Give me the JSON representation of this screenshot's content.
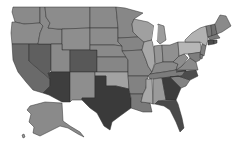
{
  "map": {
    "type": "choropleth",
    "region": "United States",
    "palette": "grayscale",
    "states": [
      {
        "id": "WA",
        "name": "Washington",
        "fill": "#8a8a8a",
        "points": "13,7 40,7 40,23 24,24 15,22 12,12"
      },
      {
        "id": "OR",
        "name": "Oregon",
        "fill": "#8c8c8c",
        "points": "12,22 15,22 24,24 40,23 43,26 40,33 38,44 12,44 11,33"
      },
      {
        "id": "CA",
        "name": "California",
        "fill": "#6a6a6a",
        "points": "12,44 29,44 29,61 50,79 50,86 43,93 33,90 26,82 18,72 13,60"
      },
      {
        "id": "NV",
        "name": "Nevada",
        "fill": "#5f5f5f",
        "points": "29,44 51,44 51,70 48,73 50,79 29,61"
      },
      {
        "id": "ID",
        "name": "Idaho",
        "fill": "#8a8a8a",
        "points": "40,7 45,7 46,17 50,23 48,28 58,29 62,29 62,44 51,44 38,44 40,33 43,26 40,23"
      },
      {
        "id": "MT",
        "name": "Montana",
        "fill": "#8c8c8c",
        "points": "45,7 90,7 90,28 62,29 58,29 48,28 50,23 46,17"
      },
      {
        "id": "WY",
        "name": "Wyoming",
        "fill": "#8e8e8e",
        "points": "62,29 90,28 90,50 62,50"
      },
      {
        "id": "UT",
        "name": "Utah",
        "fill": "#8a8a8a",
        "points": "51,44 62,44 62,50 70,50 70,72 51,72"
      },
      {
        "id": "AZ",
        "name": "Arizona",
        "fill": "#3e3e3e",
        "points": "50,72 70,72 70,102 62,102 49,95 43,93 50,86 50,79 48,73"
      },
      {
        "id": "CO",
        "name": "Colorado",
        "fill": "#585858",
        "points": "70,50 97,50 97,72 70,72"
      },
      {
        "id": "NM",
        "name": "New Mexico",
        "fill": "#8e8e8e",
        "points": "70,72 95,72 95,98 82,98 82,100 72,100 70,102"
      },
      {
        "id": "ND",
        "name": "North Dakota",
        "fill": "#8a8a8a",
        "points": "90,7 116,7 118,28 90,28"
      },
      {
        "id": "SD",
        "name": "South Dakota",
        "fill": "#8c8c8c",
        "points": "90,28 118,28 118,42 122,46 114,45 90,45"
      },
      {
        "id": "NE",
        "name": "Nebraska",
        "fill": "#8a8a8a",
        "points": "90,45 114,45 122,46 126,57 97,57 97,50 90,50"
      },
      {
        "id": "KS",
        "name": "Kansas",
        "fill": "#868686",
        "points": "97,57 126,57 128,60 128,72 97,72"
      },
      {
        "id": "OK",
        "name": "Oklahoma",
        "fill": "#a2a2a2",
        "points": "95,72 128,72 129,89 116,86 106,86 106,76 95,76"
      },
      {
        "id": "TX",
        "name": "Texas",
        "fill": "#3a3a3a",
        "points": "95,76 106,76 106,86 116,86 129,89 131,98 131,108 120,116 112,122 110,130 104,126 97,113 90,108 84,102 82,100 82,98 95,98"
      },
      {
        "id": "MN",
        "name": "Minnesota",
        "fill": "#878787",
        "points": "116,7 125,8 143,13 134,19 132,24 133,32 138,37 118,38 118,28"
      },
      {
        "id": "IA",
        "name": "Iowa",
        "fill": "#858585",
        "points": "118,38 138,37 144,42 142,50 122,51 122,46 118,42"
      },
      {
        "id": "MO",
        "name": "Missouri",
        "fill": "#878787",
        "points": "122,51 142,50 146,60 148,66 152,72 148,76 128,76 128,60 126,57"
      },
      {
        "id": "AR",
        "name": "Arkansas",
        "fill": "#828282",
        "points": "128,76 148,76 146,88 143,94 130,94 129,89"
      },
      {
        "id": "LA",
        "name": "Louisiana",
        "fill": "#7a7a7a",
        "points": "130,94 143,94 141,102 150,103 152,112 143,112 131,108 131,98"
      },
      {
        "id": "WI",
        "name": "Wisconsin",
        "fill": "#a0a0a0",
        "points": "134,19 148,22 154,26 152,40 144,42 138,37 133,32 132,24"
      },
      {
        "id": "IL",
        "name": "Illinois",
        "fill": "#a8a8a8",
        "points": "144,42 152,40 154,50 155,62 152,72 148,66 146,60 142,50"
      },
      {
        "id": "MI",
        "name": "Michigan",
        "fill": "#9c9c9c",
        "points": "158,24 164,26 166,40 160,44 156,40 156,30"
      },
      {
        "id": "IN",
        "name": "Indiana",
        "fill": "#969696",
        "points": "154,46 162,45 163,62 157,66 155,62"
      },
      {
        "id": "OH",
        "name": "Ohio",
        "fill": "#909090",
        "points": "162,45 170,45 178,42 179,56 173,62 163,62"
      },
      {
        "id": "KY",
        "name": "Kentucky",
        "fill": "#8a8a8a",
        "points": "155,64 163,62 173,62 178,64 176,70 164,72 150,74 152,72"
      },
      {
        "id": "TN",
        "name": "Tennessee",
        "fill": "#7c7c7c",
        "points": "148,76 150,74 164,72 176,70 186,70 182,76 150,79"
      },
      {
        "id": "MS",
        "name": "Mississippi",
        "fill": "#a8a8a8",
        "points": "146,79 152,79 153,104 150,103 141,102 143,94 146,88"
      },
      {
        "id": "AL",
        "name": "Alabama",
        "fill": "#9a9a9a",
        "points": "153,79 162,78 166,100 158,101 155,104 153,104"
      },
      {
        "id": "GA",
        "name": "Georgia",
        "fill": "#3c3c3c",
        "points": "162,78 170,77 181,88 176,100 166,100"
      },
      {
        "id": "FL",
        "name": "Florida",
        "fill": "#4a4a4a",
        "points": "155,104 158,101 176,100 178,104 182,118 184,128 180,132 176,122 170,110 164,106"
      },
      {
        "id": "SC",
        "name": "South Carolina",
        "fill": "#828282",
        "points": "170,77 178,76 190,80 186,86 181,88"
      },
      {
        "id": "NC",
        "name": "North Carolina",
        "fill": "#4c4c4c",
        "points": "176,72 196,70 198,76 190,80 178,76 170,77 182,76 186,70"
      },
      {
        "id": "VA",
        "name": "Virginia",
        "fill": "#8a8a8a",
        "points": "176,70 182,66 190,58 196,62 198,70 186,70"
      },
      {
        "id": "WV",
        "name": "West Virginia",
        "fill": "#8e8e8e",
        "points": "173,62 179,56 184,54 188,58 182,66 176,70 178,64"
      },
      {
        "id": "PA",
        "name": "Pennsylvania",
        "fill": "#b6b6b6",
        "points": "178,42 200,42 202,52 190,54 184,54 179,56"
      },
      {
        "id": "NY",
        "name": "New York",
        "fill": "#b2b2b2",
        "points": "185,40 192,33 200,28 206,26 208,40 206,46 200,42 185,42"
      },
      {
        "id": "MD",
        "name": "Maryland",
        "fill": "#7e7e7e",
        "points": "188,54 202,52 200,60 196,62 190,58"
      },
      {
        "id": "NJ",
        "name": "New Jersey",
        "fill": "#808080",
        "points": "202,44 206,46 204,56 200,54"
      },
      {
        "id": "VT",
        "name": "Vermont",
        "fill": "#7a7a7a",
        "points": "206,26 211,25 212,36 208,37"
      },
      {
        "id": "NH",
        "name": "New Hampshire",
        "fill": "#707070",
        "points": "211,25 215,24 217,34 212,36"
      },
      {
        "id": "ME",
        "name": "Maine",
        "fill": "#8a8a8a",
        "points": "215,24 220,15 226,16 231,26 222,32 217,34"
      },
      {
        "id": "MA",
        "name": "Massachusetts",
        "fill": "#7a7a7a",
        "points": "208,37 217,34 220,38 210,40"
      },
      {
        "id": "CT",
        "name": "Connecticut",
        "fill": "#4a4a4a",
        "points": "208,40 214,40 214,44 208,45"
      },
      {
        "id": "RI",
        "name": "Rhode Island",
        "fill": "#5a5a5a",
        "points": "214,40 217,40 217,43 214,44"
      },
      {
        "id": "DE",
        "name": "Delaware",
        "fill": "#7a7a7a",
        "points": "200,54 203,55 202,59 200,58"
      },
      {
        "id": "AK",
        "name": "Alaska",
        "fill": "#8a8a8a",
        "points": "30,106 45,102 62,103 63,121 70,126 80,132 84,137 78,134 68,128 60,126 50,131 40,136 33,133 34,127 29,122 31,114 27,110"
      },
      {
        "id": "HI",
        "name": "Hawaii",
        "fill": "#9a9a9a",
        "points": "22,135 24,134 25,137 23,138"
      }
    ],
    "lakes": [
      {
        "id": "lake-michigan",
        "points": "154,26 158,25 157,40 154,44 152,40"
      }
    ]
  }
}
